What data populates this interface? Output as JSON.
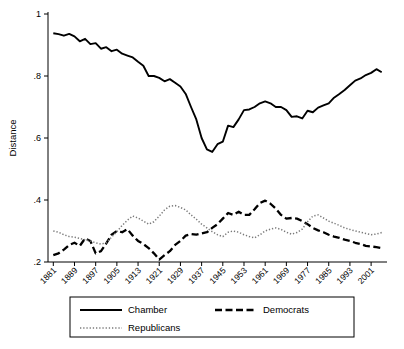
{
  "chart_data": {
    "type": "line",
    "title": "",
    "xlabel": "",
    "ylabel": "Distance",
    "ylim": [
      0.2,
      1.0
    ],
    "yticks": [
      ".2",
      ".4",
      ".6",
      ".8",
      "1"
    ],
    "ytick_values": [
      0.2,
      0.4,
      0.6,
      0.8,
      1.0
    ],
    "grid": false,
    "legend_position": "bottom",
    "xtick_labels": [
      "1881",
      "1889",
      "1897",
      "1905",
      "1913",
      "1921",
      "1929",
      "1937",
      "1945",
      "1953",
      "1961",
      "1969",
      "1977",
      "1985",
      "1993",
      "2001"
    ],
    "xtick_values": [
      1881,
      1889,
      1897,
      1905,
      1913,
      1921,
      1929,
      1937,
      1945,
      1953,
      1961,
      1969,
      1977,
      1985,
      1993,
      2001
    ],
    "xlim": [
      1879,
      2007
    ],
    "x": [
      1881,
      1883,
      1885,
      1887,
      1889,
      1891,
      1893,
      1895,
      1897,
      1899,
      1901,
      1903,
      1905,
      1907,
      1909,
      1911,
      1913,
      1915,
      1917,
      1919,
      1921,
      1923,
      1925,
      1927,
      1929,
      1931,
      1933,
      1935,
      1937,
      1939,
      1941,
      1943,
      1945,
      1947,
      1949,
      1951,
      1953,
      1955,
      1957,
      1959,
      1961,
      1963,
      1965,
      1967,
      1969,
      1971,
      1973,
      1975,
      1977,
      1979,
      1981,
      1983,
      1985,
      1987,
      1989,
      1991,
      1993,
      1995,
      1997,
      1999,
      2001,
      2003,
      2005
    ],
    "series": [
      {
        "name": "Chamber",
        "style": "solid",
        "color": "#000000",
        "values": [
          0.938,
          0.935,
          0.93,
          0.936,
          0.928,
          0.912,
          0.92,
          0.903,
          0.906,
          0.888,
          0.893,
          0.88,
          0.885,
          0.872,
          0.866,
          0.86,
          0.846,
          0.833,
          0.8,
          0.8,
          0.794,
          0.783,
          0.79,
          0.778,
          0.766,
          0.742,
          0.7,
          0.66,
          0.6,
          0.563,
          0.555,
          0.58,
          0.588,
          0.64,
          0.635,
          0.66,
          0.69,
          0.692,
          0.7,
          0.712,
          0.718,
          0.712,
          0.7,
          0.7,
          0.69,
          0.668,
          0.67,
          0.663,
          0.688,
          0.683,
          0.698,
          0.705,
          0.712,
          0.73,
          0.742,
          0.755,
          0.77,
          0.785,
          0.792,
          0.803,
          0.81,
          0.822,
          0.812
        ]
      },
      {
        "name": "Democrats",
        "style": "dashed",
        "color": "#000000",
        "values": [
          0.222,
          0.228,
          0.24,
          0.255,
          0.262,
          0.252,
          0.276,
          0.268,
          0.228,
          0.235,
          0.26,
          0.288,
          0.3,
          0.296,
          0.306,
          0.285,
          0.268,
          0.258,
          0.245,
          0.228,
          0.208,
          0.222,
          0.235,
          0.255,
          0.268,
          0.285,
          0.29,
          0.288,
          0.292,
          0.296,
          0.31,
          0.322,
          0.34,
          0.358,
          0.352,
          0.362,
          0.352,
          0.352,
          0.37,
          0.39,
          0.398,
          0.388,
          0.372,
          0.352,
          0.34,
          0.342,
          0.34,
          0.332,
          0.322,
          0.31,
          0.302,
          0.296,
          0.288,
          0.282,
          0.278,
          0.272,
          0.268,
          0.262,
          0.258,
          0.252,
          0.25,
          0.248,
          0.245
        ]
      },
      {
        "name": "Republicans",
        "style": "dotted",
        "color": "#000000",
        "values": [
          0.3,
          0.296,
          0.288,
          0.282,
          0.28,
          0.276,
          0.272,
          0.268,
          0.262,
          0.258,
          0.262,
          0.28,
          0.298,
          0.318,
          0.335,
          0.348,
          0.342,
          0.332,
          0.322,
          0.33,
          0.348,
          0.368,
          0.38,
          0.382,
          0.376,
          0.368,
          0.352,
          0.338,
          0.322,
          0.31,
          0.298,
          0.288,
          0.282,
          0.296,
          0.3,
          0.296,
          0.288,
          0.282,
          0.278,
          0.288,
          0.3,
          0.306,
          0.31,
          0.305,
          0.296,
          0.29,
          0.295,
          0.306,
          0.33,
          0.348,
          0.352,
          0.342,
          0.332,
          0.325,
          0.318,
          0.31,
          0.305,
          0.3,
          0.296,
          0.292,
          0.288,
          0.29,
          0.295
        ]
      }
    ]
  },
  "legend": {
    "items": [
      {
        "label": "Chamber",
        "style": "solid"
      },
      {
        "label": "Democrats",
        "style": "dashed"
      },
      {
        "label": "Republicans",
        "style": "dotted"
      }
    ]
  }
}
